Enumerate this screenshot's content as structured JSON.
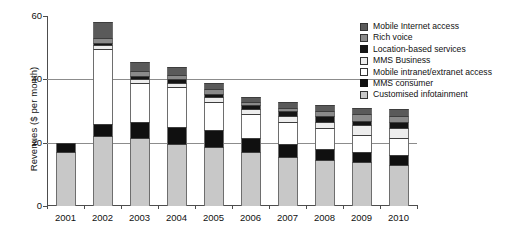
{
  "chart_data": {
    "type": "bar",
    "stacked": true,
    "title": "",
    "xlabel": "",
    "ylabel": "Revenues ($ per month)",
    "ylim": [
      0,
      60
    ],
    "yticks": [
      0,
      20,
      40,
      60
    ],
    "grid": "horizontal gridlines at 20 and 40",
    "legend_position": "right",
    "categories": [
      "2001",
      "2002",
      "2003",
      "2004",
      "2005",
      "2006",
      "2007",
      "2008",
      "2009",
      "2010"
    ],
    "series": [
      {
        "name": "Customised infotainment",
        "color": "#c8c8c8",
        "values": [
          17.0,
          22.0,
          21.5,
          19.5,
          18.5,
          17.0,
          15.5,
          14.5,
          14.0,
          13.0
        ]
      },
      {
        "name": "MMS consumer",
        "color": "#101010",
        "values": [
          3.0,
          4.0,
          5.0,
          5.5,
          5.5,
          4.5,
          4.0,
          3.5,
          3.0,
          3.0
        ]
      },
      {
        "name": "Mobile intranet/extranet access",
        "color": "#ffffff",
        "values": [
          0.0,
          23.5,
          12.5,
          12.5,
          9.0,
          7.5,
          7.0,
          6.5,
          5.5,
          5.5
        ]
      },
      {
        "name": "MMS Business",
        "color": "#ededed",
        "values": [
          0.0,
          1.2,
          1.2,
          1.5,
          1.5,
          1.5,
          2.0,
          2.0,
          3.0,
          3.0
        ]
      },
      {
        "name": "Location-based services",
        "color": "#141414",
        "values": [
          0.0,
          0.8,
          0.8,
          1.0,
          1.0,
          1.5,
          1.5,
          2.0,
          1.5,
          2.0
        ]
      },
      {
        "name": "Rich voice",
        "color": "#8a8a8a",
        "values": [
          0.0,
          1.5,
          1.5,
          1.5,
          1.5,
          1.0,
          1.0,
          1.5,
          2.0,
          2.0
        ]
      },
      {
        "name": "Mobile Internet access",
        "color": "#5a5a5a",
        "values": [
          0.0,
          5.0,
          3.0,
          2.5,
          2.0,
          1.5,
          2.0,
          2.0,
          2.0,
          2.0
        ]
      }
    ],
    "totals": [
      20.0,
      58.0,
      45.5,
      44.0,
      39.0,
      34.5,
      33.0,
      32.0,
      31.0,
      30.5
    ]
  },
  "legend": {
    "items": [
      {
        "label": "Mobile Internet access",
        "color": "#5a5a5a",
        "border": "#333333"
      },
      {
        "label": "Rich voice",
        "color": "#8a8a8a",
        "border": "#333333"
      },
      {
        "label": "Location-based services",
        "color": "#141414",
        "border": "#141414"
      },
      {
        "label": "MMS Business",
        "color": "#ededed",
        "border": "#333333"
      },
      {
        "label": "Mobile intranet/extranet access",
        "color": "#ffffff",
        "border": "#333333"
      },
      {
        "label": "MMS consumer",
        "color": "#101010",
        "border": "#101010"
      },
      {
        "label": "Customised infotainment",
        "color": "#c8c8c8",
        "border": "#333333"
      }
    ]
  },
  "axes": {
    "y_title": "Revenues ($ per month)",
    "y_tick_labels": [
      "0",
      "20",
      "40",
      "60"
    ],
    "x_tick_labels": [
      "2001",
      "2002",
      "2003",
      "2004",
      "2005",
      "2006",
      "2007",
      "2008",
      "2009",
      "2010"
    ]
  }
}
